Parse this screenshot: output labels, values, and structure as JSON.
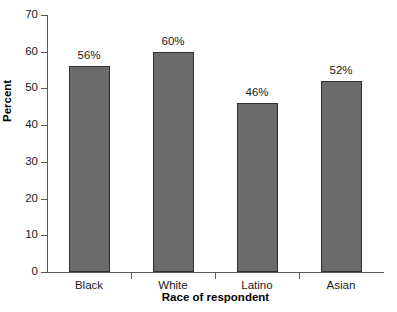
{
  "chart_data": {
    "type": "bar",
    "title": "",
    "categories": [
      "Black",
      "White",
      "Latino",
      "Asian"
    ],
    "values": [
      56,
      60,
      46,
      52
    ],
    "data_labels": [
      "56%",
      "60%",
      "46%",
      "52%"
    ],
    "xlabel": "Race of respondent",
    "ylabel": "Percent",
    "ylim": [
      0,
      70
    ],
    "yticks": [
      0,
      10,
      20,
      30,
      40,
      50,
      60,
      70
    ],
    "ytick_labels": [
      "0",
      "10",
      "20",
      "30",
      "40",
      "50",
      "60",
      "70"
    ],
    "grid": false,
    "legend": false,
    "bar_color": "#6b6b6b",
    "bar_edge_color": "#2f2f2f",
    "axis_color": "#5a5a5a",
    "background": "#ffffff"
  }
}
